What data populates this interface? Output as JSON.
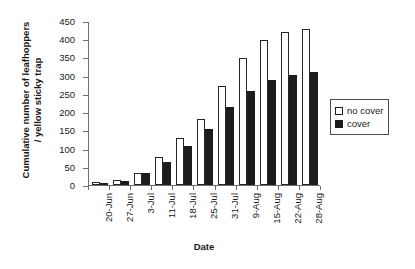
{
  "chart_data": {
    "type": "bar",
    "title": "",
    "xlabel": "Date",
    "ylabel": "Cumulative number of leafhoppers / yellow sticky trap",
    "ylabel_line1": "Cumulative number of leafhoppers",
    "ylabel_line2": "/ yellow sticky trap",
    "ylim": [
      0,
      450
    ],
    "ytick_labels": [
      "450",
      "400",
      "350",
      "300",
      "250",
      "200",
      "150",
      "100",
      "50",
      "0"
    ],
    "ytick_values": [
      450,
      400,
      350,
      300,
      250,
      200,
      150,
      100,
      50,
      0
    ],
    "grid": false,
    "legend_position": "right",
    "categories": [
      "20-Jun",
      "27-Jun",
      "3-Jul",
      "11-Jul",
      "18-Jul",
      "25-Jul",
      "31-Jul",
      "9-Aug",
      "15-Aug",
      "22-Aug",
      "28-Aug"
    ],
    "series": [
      {
        "name": "no cover",
        "color": "#ffffff",
        "edge_color": "#262626",
        "values": [
          8,
          15,
          32,
          78,
          128,
          182,
          272,
          348,
          397,
          420,
          428
        ]
      },
      {
        "name": "cover",
        "color": "#1c1c1c",
        "edge_color": "#1c1c1c",
        "values": [
          5,
          12,
          32,
          62,
          107,
          155,
          213,
          257,
          287,
          303,
          310
        ]
      }
    ]
  },
  "legend": {
    "items": [
      {
        "label": "no cover",
        "swatch": "nocover"
      },
      {
        "label": "cover",
        "swatch": "cover"
      }
    ]
  },
  "colors": {
    "axis": "#6e6e6e",
    "text": "#1a1a1a",
    "cover_fill": "#1c1c1c",
    "nocover_fill": "#ffffff",
    "background": "#ffffff"
  }
}
